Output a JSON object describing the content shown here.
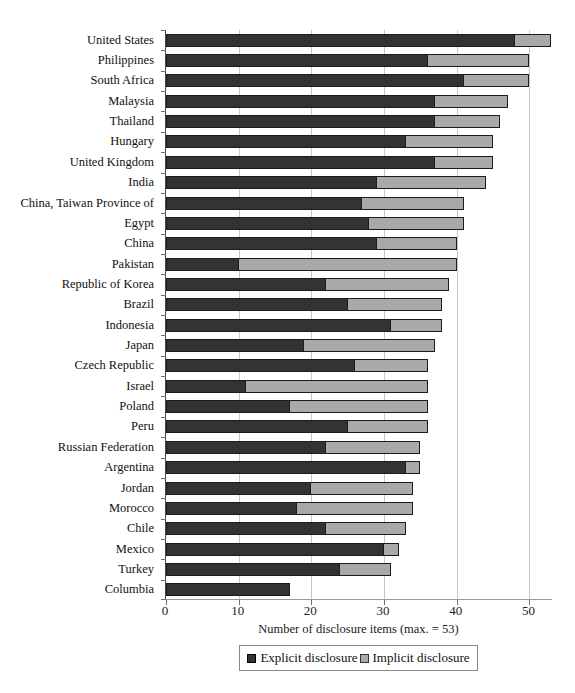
{
  "chart_data": {
    "type": "bar",
    "orientation": "horizontal",
    "stacked": true,
    "title": "",
    "xlabel": "Number of disclosure items (max. = 53)",
    "ylabel": "",
    "xlim": [
      0,
      53.25
    ],
    "xticks": [
      0,
      10,
      20,
      30,
      40,
      50
    ],
    "grid": "vertical",
    "legend_position": "bottom",
    "categories": [
      "United States",
      "Philippines",
      "South Africa",
      "Malaysia",
      "Thailand",
      "Hungary",
      "United Kingdom",
      "India",
      "China, Taiwan Province of",
      "Egypt",
      "China",
      "Pakistan",
      "Republic of Korea",
      "Brazil",
      "Indonesia",
      "Japan",
      "Czech Republic",
      "Israel",
      "Poland",
      "Peru",
      "Russian Federation",
      "Argentina",
      "Jordan",
      "Morocco",
      "Chile",
      "Mexico",
      "Turkey",
      "Columbia"
    ],
    "series": [
      {
        "name": "Explicit disclosure",
        "color": "#333333",
        "values": [
          48,
          36,
          41,
          37,
          37,
          33,
          37,
          29,
          27,
          28,
          29,
          10,
          22,
          25,
          31,
          19,
          26,
          11,
          17,
          25,
          22,
          33,
          20,
          18,
          22,
          30,
          24,
          17
        ]
      },
      {
        "name": "Implicit disclosure",
        "color": "#a9a9a9",
        "values": [
          5,
          14,
          9,
          10,
          9,
          12,
          8,
          15,
          14,
          13,
          11,
          30,
          17,
          13,
          7,
          18,
          10,
          25,
          19,
          11,
          13,
          2,
          14,
          16,
          11,
          2,
          7,
          0
        ]
      }
    ],
    "totals": [
      53,
      50,
      50,
      47,
      46,
      45,
      45,
      44,
      41,
      41,
      40,
      40,
      39,
      38,
      38,
      37,
      36,
      36,
      36,
      36,
      35,
      35,
      34,
      34,
      33,
      32,
      31,
      17
    ]
  },
  "colors": {
    "explicit": "#333333",
    "implicit": "#a9a9a9",
    "bar_border": "#1c1c1c",
    "gridline": "#c8c8c8",
    "axis": "#6f6f6f",
    "text": "#111111",
    "legend_border": "#8a8a8a",
    "background": "#ffffff"
  }
}
